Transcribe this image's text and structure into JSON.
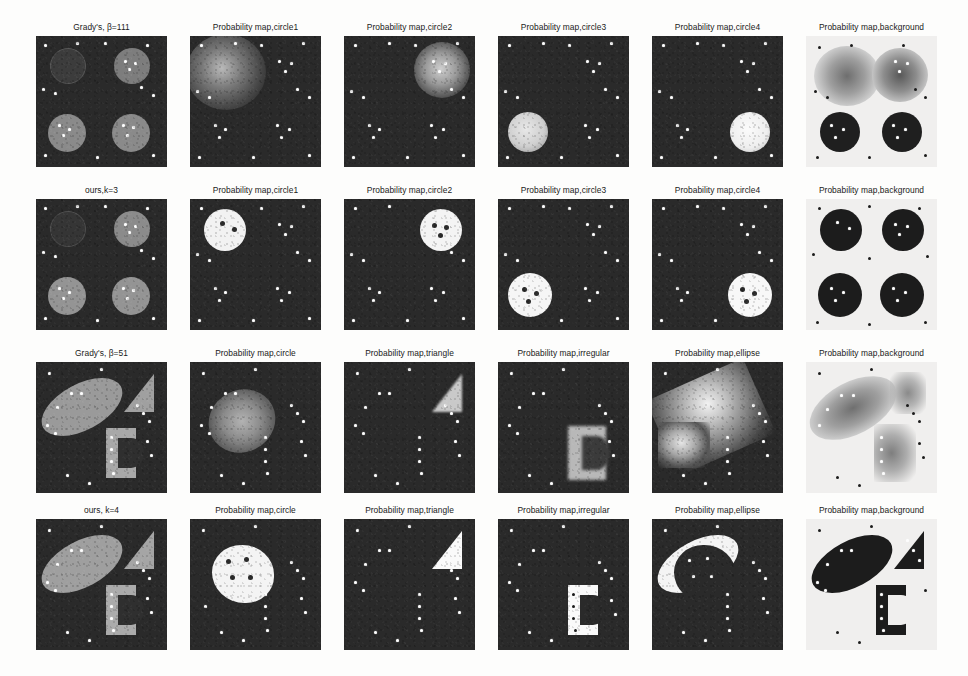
{
  "figure": {
    "type": "image-grid",
    "rows": 4,
    "cols": 6,
    "background_color": "#fdfdfc",
    "panel_dark_color": "#2a2a2a",
    "panel_light_color": "#f0efee"
  },
  "grid": {
    "rows": [
      {
        "id": "row-1",
        "method": "Grady's, β=111",
        "dataset": "four-circles",
        "sharpness": "diffuse",
        "cells": [
          {
            "caption": "Grady's, β=111",
            "kind": "segmentation",
            "tone": "dark"
          },
          {
            "caption": "Probability map,circle1",
            "kind": "probability",
            "tone": "dark"
          },
          {
            "caption": "Probability map,circle2",
            "kind": "probability",
            "tone": "dark"
          },
          {
            "caption": "Probability map,circle3",
            "kind": "probability",
            "tone": "dark"
          },
          {
            "caption": "Probability map,circle4",
            "kind": "probability",
            "tone": "dark"
          },
          {
            "caption": "Probability map,background",
            "kind": "probability",
            "tone": "light"
          }
        ]
      },
      {
        "id": "row-2",
        "method": "ours,k=3",
        "dataset": "four-circles",
        "sharpness": "sharp",
        "cells": [
          {
            "caption": "ours,k=3",
            "kind": "segmentation",
            "tone": "dark"
          },
          {
            "caption": "Probability map,circle1",
            "kind": "probability",
            "tone": "dark"
          },
          {
            "caption": "Probability map,circle2",
            "kind": "probability",
            "tone": "dark"
          },
          {
            "caption": "Probability map,circle3",
            "kind": "probability",
            "tone": "dark"
          },
          {
            "caption": "Probability map,circle4",
            "kind": "probability",
            "tone": "dark"
          },
          {
            "caption": "Probability map,background",
            "kind": "probability",
            "tone": "light"
          }
        ]
      },
      {
        "id": "row-3",
        "method": "Grady's, β=51",
        "dataset": "mixed-shapes",
        "sharpness": "diffuse",
        "cells": [
          {
            "caption": "Grady's, β=51",
            "kind": "segmentation",
            "tone": "dark"
          },
          {
            "caption": "Probability map,circle",
            "kind": "probability",
            "tone": "dark"
          },
          {
            "caption": "Probability map,triangle",
            "kind": "probability",
            "tone": "dark"
          },
          {
            "caption": "Probability map,irregular",
            "kind": "probability",
            "tone": "dark"
          },
          {
            "caption": "Probability map,ellipse",
            "kind": "probability",
            "tone": "dark"
          },
          {
            "caption": "Probability map,background",
            "kind": "probability",
            "tone": "light"
          }
        ]
      },
      {
        "id": "row-4",
        "method": "ours, k=4",
        "dataset": "mixed-shapes",
        "sharpness": "sharp",
        "cells": [
          {
            "caption": "ours, k=4",
            "kind": "segmentation",
            "tone": "dark"
          },
          {
            "caption": "Probability map,circle",
            "kind": "probability",
            "tone": "dark"
          },
          {
            "caption": "Probability map,triangle",
            "kind": "probability",
            "tone": "dark"
          },
          {
            "caption": "Probability map,irregular",
            "kind": "probability",
            "tone": "dark"
          },
          {
            "caption": "Probability map,ellipse",
            "kind": "probability",
            "tone": "dark"
          },
          {
            "caption": "Probability map,background",
            "kind": "probability",
            "tone": "light"
          }
        ]
      }
    ]
  },
  "captions": {
    "r1c1": "Grady's, β=111",
    "r1c2": "Probability map,circle1",
    "r1c3": "Probability map,circle2",
    "r1c4": "Probability map,circle3",
    "r1c5": "Probability map,circle4",
    "r1c6": "Probability map,background",
    "r2c1": "ours,k=3",
    "r2c2": "Probability map,circle1",
    "r2c3": "Probability map,circle2",
    "r2c4": "Probability map,circle3",
    "r2c5": "Probability map,circle4",
    "r2c6": "Probability map,background",
    "r3c1": "Grady's, β=51",
    "r3c2": "Probability map,circle",
    "r3c3": "Probability map,triangle",
    "r3c4": "Probability map,irregular",
    "r3c5": "Probability map,ellipse",
    "r3c6": "Probability map,background",
    "r4c1": "ours, k=4",
    "r4c2": "Probability map,circle",
    "r4c3": "Probability map,triangle",
    "r4c4": "Probability map,irregular",
    "r4c5": "Probability map,ellipse",
    "r4c6": "Probability map,background"
  }
}
